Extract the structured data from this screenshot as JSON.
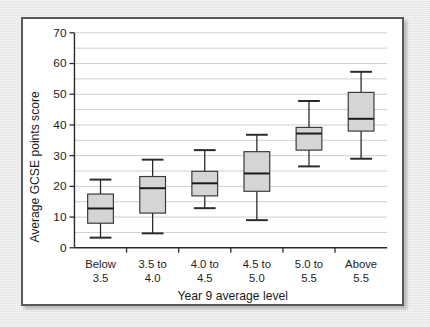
{
  "chart_data": {
    "type": "box",
    "title": "",
    "xlabel": "Year 9 average level",
    "ylabel": "Average GCSE points score",
    "ylim": [
      0,
      70
    ],
    "y_major_ticks": [
      0,
      10,
      20,
      30,
      40,
      50,
      60,
      70
    ],
    "y_gridlines": [
      5,
      10,
      15,
      20,
      25,
      30,
      35,
      40,
      45,
      50,
      55,
      60,
      65,
      70
    ],
    "grid": true,
    "legend": "none",
    "categories": [
      "Below\n3.5",
      "3.5 to\n4.0",
      "4.0 to\n4.5",
      "4.5 to\n5.0",
      "5.0 to\n5.5",
      "Above\n5.5"
    ],
    "category_lines": [
      [
        "Below",
        "3.5"
      ],
      [
        "3.5 to",
        "4.0"
      ],
      [
        "4.0 to",
        "4.5"
      ],
      [
        "4.5 to",
        "5.0"
      ],
      [
        "5.0 to",
        "5.5"
      ],
      [
        "Above",
        "5.5"
      ]
    ],
    "boxes": [
      {
        "category": "Below 3.5",
        "whisker_low": 3.3,
        "q1": 8.0,
        "median": 12.8,
        "q3": 17.5,
        "whisker_high": 22.2
      },
      {
        "category": "3.5 to 4.0",
        "whisker_low": 4.7,
        "q1": 11.3,
        "median": 19.4,
        "q3": 23.2,
        "whisker_high": 28.7
      },
      {
        "category": "4.0 to 4.5",
        "whisker_low": 12.9,
        "q1": 16.9,
        "median": 21.0,
        "q3": 24.9,
        "whisker_high": 31.8
      },
      {
        "category": "4.5 to 5.0",
        "whisker_low": 9.0,
        "q1": 18.4,
        "median": 24.2,
        "q3": 31.3,
        "whisker_high": 36.8
      },
      {
        "category": "5.0 to 5.5",
        "whisker_low": 26.5,
        "q1": 31.8,
        "median": 37.2,
        "q3": 39.2,
        "whisker_high": 47.8
      },
      {
        "category": "Above 5.5",
        "whisker_low": 29.0,
        "q1": 38.0,
        "median": 42.0,
        "q3": 50.6,
        "whisker_high": 57.3
      }
    ]
  },
  "colors": {
    "box_fill": "#d5d5d5",
    "box_stroke": "#3a3a3a",
    "median": "#1a1a1a",
    "grid": "#c9c9c9",
    "axis": "#2a2a2a",
    "frame": "#59595b",
    "page_background": "#e9e9e7",
    "plot_background": "#ffffff"
  }
}
